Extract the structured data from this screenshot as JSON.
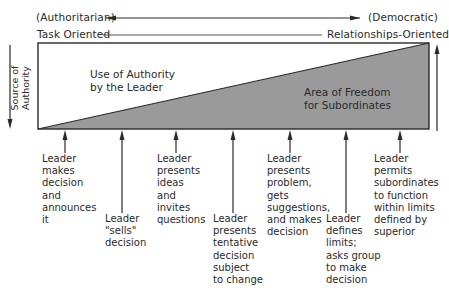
{
  "top_axis": {
    "left_label": "(Authoritarian)",
    "right_label": "(Democratic)"
  },
  "orientation_axis": {
    "left_label": "Task Oriented",
    "right_label": "Relationships-Oriented"
  },
  "side_labels": {
    "left": "Source of\nAuthority"
  },
  "regions": {
    "upper": "Use of Authority\nby the Leader",
    "lower": "Area of Freedom\nfor Subordinates"
  },
  "colors": {
    "shaded_area": "#9a9a9a",
    "line": "#2a2a2a",
    "background": "#ffffff"
  },
  "behaviors": [
    {
      "label": "Leader\nmakes\ndecision\nand\nannounces\nit"
    },
    {
      "label": "Leader\n\"sells\"\ndecision"
    },
    {
      "label": "Leader\npresents\nideas\nand\ninvites\nquestions"
    },
    {
      "label": "Leader\npresents\ntentative\ndecision\nsubject\nto change"
    },
    {
      "label": "Leader\npresents\nproblem,\ngets\nsuggestions,\nand makes\ndecision"
    },
    {
      "label": "Leader\ndefines\nlimits;\nasks group\nto make\ndecision"
    },
    {
      "label": "Leader\npermits\nsubordinates\nto function\nwithin limits\ndefined by\nsuperior"
    }
  ]
}
